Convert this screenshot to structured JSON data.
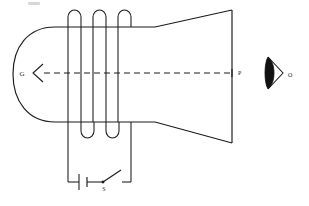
{
  "figure": {
    "background_color": "#ffffff",
    "line_color": "#1a1a1a",
    "width": 309,
    "height": 206
  },
  "labels": {
    "cathode": "G",
    "screen_point": "P",
    "observer": "O",
    "switch": "S"
  },
  "components": {
    "tube": {
      "name": "cathode-ray-tube",
      "neck_rounded_end": "left",
      "flare_direction": "right"
    },
    "coil": {
      "name": "solenoid-coil",
      "turns": 3,
      "top_arch_count": 3,
      "bottom_arc_count": 2
    },
    "electron_beam": {
      "name": "beam-axis",
      "style": "dashed",
      "arrow_direction": "left"
    },
    "screen": {
      "name": "fluorescent-screen",
      "orientation": "vertical"
    },
    "circuit": {
      "battery": "battery-cell",
      "switch_state": "open"
    },
    "eye": {
      "name": "observer-eye",
      "facing": "left"
    }
  }
}
